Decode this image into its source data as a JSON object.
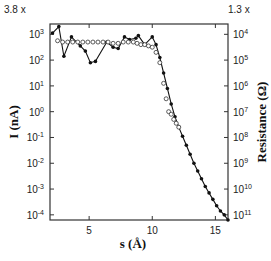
{
  "chart_data": {
    "type": "line",
    "title": "",
    "xlabel": "s (Å)",
    "ylabel": "I (nA)",
    "y2label": "Resistance (Ω)",
    "xlim": [
      1.9,
      16.0
    ],
    "ylim_log10": [
      -4.2,
      3.4
    ],
    "x_ticks": [
      5,
      10,
      15
    ],
    "y_ticks": [
      "10^3",
      "10^2",
      "10^1",
      "10^0",
      "10^-1",
      "10^-2",
      "10^-3",
      "10^-4"
    ],
    "y2_ticks": [
      "10^4",
      "10^5",
      "10^6",
      "10^7",
      "10^8",
      "10^9",
      "10^10",
      "10^11"
    ],
    "y_scale_note": "3.8 x",
    "y2_scale_note": "1.3 x",
    "yscale": "log",
    "grid": false,
    "legend": null,
    "series": [
      {
        "name": "filled-markers-line",
        "marker": "filled-circle",
        "line": true,
        "x": [
          2.1,
          2.6,
          3.0,
          3.6,
          4.3,
          4.7,
          5.1,
          5.5,
          6.4,
          6.9,
          7.3,
          7.8,
          8.2,
          8.7,
          8.9,
          9.4,
          10.0,
          10.3,
          10.6,
          10.9,
          11.2,
          11.5,
          11.8,
          12.1,
          12.4,
          12.7,
          13.0,
          13.3,
          13.6,
          13.9,
          14.2,
          14.5,
          14.8,
          15.1,
          15.4,
          15.7,
          16.0
        ],
        "log10_y": [
          3.05,
          3.3,
          2.15,
          2.9,
          2.55,
          2.35,
          1.9,
          1.95,
          2.7,
          2.5,
          2.45,
          2.9,
          2.8,
          2.85,
          2.95,
          2.6,
          2.9,
          2.6,
          2.1,
          1.5,
          0.9,
          0.3,
          -0.2,
          -0.6,
          -0.95,
          -1.3,
          -1.65,
          -2.0,
          -2.3,
          -2.6,
          -2.9,
          -3.15,
          -3.4,
          -3.65,
          -3.85,
          -4.0,
          -4.2
        ]
      },
      {
        "name": "open-markers",
        "marker": "open-circle",
        "line": false,
        "x": [
          2.5,
          2.9,
          3.3,
          3.7,
          4.1,
          4.5,
          4.9,
          5.3,
          5.7,
          6.1,
          6.5,
          6.9,
          7.3,
          7.7,
          8.1,
          8.5,
          8.8,
          9.1,
          9.4,
          9.7,
          10.0,
          10.3,
          10.6,
          10.9,
          11.1,
          11.3,
          11.5,
          11.7,
          11.9,
          12.1
        ],
        "log10_y": [
          2.75,
          2.7,
          2.7,
          2.7,
          2.7,
          2.7,
          2.7,
          2.7,
          2.7,
          2.7,
          2.7,
          2.65,
          2.65,
          2.7,
          2.7,
          2.7,
          2.65,
          2.6,
          2.6,
          2.55,
          2.5,
          2.3,
          1.9,
          1.1,
          0.5,
          0.0,
          -0.1,
          -0.3,
          -0.45,
          -0.6
        ]
      }
    ]
  }
}
